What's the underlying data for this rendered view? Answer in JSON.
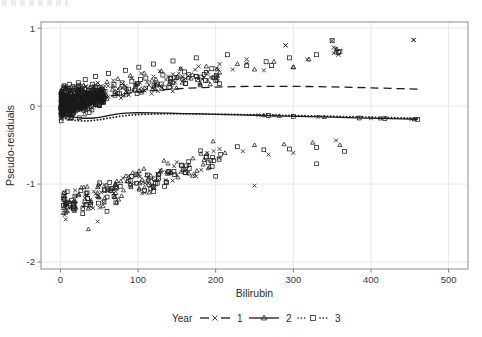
{
  "figure": {
    "width": 482,
    "height": 337,
    "background": "#ffffff"
  },
  "plot_area": {
    "left": 41,
    "top": 22,
    "right": 468,
    "bottom": 269,
    "frame_color": "#8c8c8c",
    "grid_color": "#e2e2e2"
  },
  "axes": {
    "x": {
      "title": "Bilirubin",
      "ticks": [
        0,
        100,
        200,
        300,
        400,
        500
      ],
      "tick_labels": [
        "0",
        "100",
        "200",
        "300",
        "400",
        "500"
      ],
      "min": -25,
      "max": 525
    },
    "y": {
      "title": "Pseudo-residuals",
      "ticks": [
        1,
        0,
        -1,
        -2
      ],
      "tick_labels": [
        "1",
        "0",
        "-1",
        "-2"
      ],
      "min": -2.09,
      "max": 1.08
    }
  },
  "legend": {
    "title": "Year",
    "position": "bottom",
    "entries": [
      {
        "label": "1",
        "marker": "cross",
        "line": "dashed",
        "color": "#1a1a1a"
      },
      {
        "label": "2",
        "marker": "triangle",
        "line": "solid",
        "color": "#1a1a1a"
      },
      {
        "label": "3",
        "marker": "square",
        "line": "dotted",
        "color": "#1a1a1a"
      }
    ]
  },
  "chart_data": {
    "type": "scatter",
    "title": "",
    "subtitle": "",
    "xlabel": "Bilirubin",
    "ylabel": "Pseudo-residuals",
    "xlim": [
      -25,
      525
    ],
    "ylim": [
      -2.09,
      1.08
    ],
    "grid": true,
    "legend_title": "Year",
    "legend_position": "bottom",
    "marker_color": "#1a1a1a",
    "marker_fill": "none",
    "series": [
      {
        "name": "1",
        "marker": "cross",
        "line": "dashed",
        "trend_line": {
          "x": [
            3,
            10,
            20,
            30,
            40,
            50,
            60,
            70,
            80,
            90,
            100,
            120,
            140,
            160,
            180,
            200,
            230,
            260,
            290,
            320,
            350,
            380,
            410,
            440,
            460
          ],
          "y": [
            -0.09,
            -0.03,
            0.02,
            0.05,
            0.08,
            0.1,
            0.12,
            0.14,
            0.155,
            0.17,
            0.18,
            0.2,
            0.215,
            0.228,
            0.238,
            0.245,
            0.252,
            0.255,
            0.255,
            0.252,
            0.247,
            0.24,
            0.232,
            0.224,
            0.219
          ]
        },
        "points_x": [
          2,
          3,
          4,
          5,
          6,
          7,
          8,
          9,
          10,
          11,
          12,
          13,
          14,
          15,
          16,
          17,
          18,
          19,
          20,
          21,
          22,
          24,
          26,
          28,
          30,
          33,
          36,
          40,
          44,
          48,
          52,
          57,
          62,
          68,
          74,
          80,
          86,
          92,
          98,
          104,
          112,
          120,
          128,
          136,
          145,
          155,
          165,
          178,
          190,
          205,
          222,
          240,
          262,
          290,
          318,
          350,
          352,
          355,
          358,
          455
        ],
        "points_y": [
          -0.11,
          -0.05,
          0.03,
          0.08,
          -0.02,
          0.12,
          0.05,
          -0.08,
          0.15,
          0.02,
          0.1,
          -0.04,
          0.18,
          0.07,
          -0.01,
          0.13,
          0.2,
          0.05,
          -0.06,
          0.16,
          0.09,
          0.22,
          0.11,
          0.02,
          0.18,
          0.25,
          0.14,
          0.07,
          0.21,
          0.3,
          0.17,
          0.26,
          0.12,
          0.33,
          0.22,
          0.29,
          0.18,
          0.36,
          0.27,
          0.42,
          0.31,
          0.38,
          0.45,
          0.34,
          0.41,
          0.48,
          0.39,
          0.51,
          0.44,
          0.54,
          0.47,
          0.55,
          0.46,
          0.78,
          0.6,
          0.84,
          0.68,
          0.74,
          0.66,
          0.85
        ]
      },
      {
        "name": "2",
        "marker": "triangle",
        "line": "solid",
        "trend_line": {
          "x": [
            3,
            10,
            20,
            30,
            40,
            50,
            60,
            70,
            80,
            90,
            100,
            120,
            140,
            160,
            180,
            200,
            230,
            260,
            290,
            320,
            350,
            380,
            410,
            440,
            460
          ],
          "y": [
            -0.105,
            -0.125,
            -0.145,
            -0.155,
            -0.155,
            -0.145,
            -0.125,
            -0.105,
            -0.092,
            -0.086,
            -0.084,
            -0.086,
            -0.09,
            -0.095,
            -0.1,
            -0.105,
            -0.113,
            -0.12,
            -0.128,
            -0.135,
            -0.142,
            -0.15,
            -0.157,
            -0.164,
            -0.168
          ]
        },
        "points_x": [
          3,
          5,
          7,
          9,
          11,
          13,
          15,
          17,
          19,
          21,
          24,
          27,
          30,
          34,
          38,
          43,
          48,
          54,
          60,
          67,
          74,
          82,
          90,
          99,
          108,
          118,
          130,
          142,
          155,
          170,
          188,
          205,
          228,
          250,
          275,
          300,
          355
        ],
        "points_y": [
          -0.09,
          -0.13,
          -0.05,
          0.02,
          -0.11,
          0.07,
          -0.02,
          0.12,
          -0.07,
          0.16,
          0.05,
          -0.04,
          0.2,
          0.1,
          0.24,
          0.14,
          0.28,
          0.18,
          0.31,
          0.21,
          0.35,
          0.25,
          0.39,
          0.29,
          0.42,
          0.33,
          0.45,
          0.36,
          0.48,
          0.4,
          0.51,
          0.43,
          0.54,
          0.47,
          0.57,
          0.5,
          0.7
        ]
      },
      {
        "name": "3",
        "marker": "square",
        "line": "dotted",
        "trend_line": {
          "x": [
            3,
            10,
            20,
            30,
            40,
            50,
            60,
            70,
            80,
            90,
            100,
            120,
            140,
            160,
            180,
            200,
            230,
            260,
            290,
            320,
            350,
            380,
            410,
            440,
            460
          ],
          "y": [
            -0.145,
            -0.17,
            -0.185,
            -0.19,
            -0.186,
            -0.175,
            -0.158,
            -0.14,
            -0.125,
            -0.115,
            -0.108,
            -0.1,
            -0.098,
            -0.098,
            -0.1,
            -0.102,
            -0.107,
            -0.112,
            -0.118,
            -0.124,
            -0.13,
            -0.137,
            -0.144,
            -0.151,
            -0.156
          ]
        },
        "points_x": [
          2,
          4,
          6,
          8,
          10,
          12,
          14,
          16,
          18,
          20,
          23,
          26,
          29,
          32,
          36,
          40,
          45,
          50,
          56,
          62,
          69,
          76,
          84,
          92,
          101,
          110,
          120,
          132,
          145,
          160,
          175,
          195,
          215,
          240,
          265,
          295,
          330,
          360
        ],
        "points_y": [
          0.05,
          -0.08,
          0.14,
          -0.02,
          0.2,
          0.08,
          -0.06,
          0.25,
          0.11,
          -0.01,
          0.3,
          0.16,
          0.04,
          0.34,
          0.2,
          0.08,
          0.38,
          0.24,
          0.12,
          0.42,
          0.28,
          0.16,
          0.46,
          0.32,
          0.5,
          0.36,
          0.54,
          0.4,
          0.58,
          0.44,
          0.62,
          0.48,
          0.66,
          0.52,
          0.57,
          0.62,
          0.66,
          0.7
        ]
      }
    ],
    "lower_band_note": "Second cluster of residuals between -0.45 and -1.65",
    "n_points_approx": 900
  }
}
